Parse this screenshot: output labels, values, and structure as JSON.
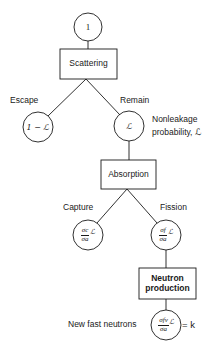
{
  "diagram": {
    "start_node": {
      "label": "1"
    },
    "scattering_box": {
      "label": "Scattering"
    },
    "escape_branch": {
      "label": "Escape",
      "value": "1 − ℒ"
    },
    "remain_branch": {
      "label": "Remain",
      "value": "ℒ"
    },
    "nonleakage_note": {
      "line1": "Nonleakage",
      "line2": "probability, ℒ"
    },
    "absorption_box": {
      "label": "Absorption"
    },
    "capture_branch": {
      "label": "Capture",
      "num": "σc",
      "den": "σa",
      "factor": "ℒ"
    },
    "fission_branch": {
      "label": "Fission",
      "num": "σf",
      "den": "σa",
      "factor": "ℒ"
    },
    "neutron_production_box": {
      "line1": "Neutron",
      "line2": "production"
    },
    "result": {
      "label": "New fast neutrons",
      "num": "σfν",
      "den": "σa",
      "factor": "ℒ",
      "equals": "= k"
    },
    "colors": {
      "line": "#1a1a1a",
      "background": "#ffffff"
    }
  }
}
